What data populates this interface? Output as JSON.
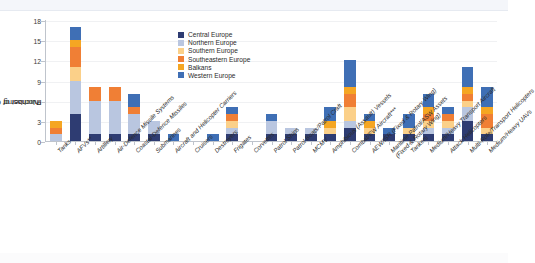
{
  "figure": {
    "ylabel_line1": "Number of Countries",
    "ylabel_line2": "Purchasing"
  },
  "legend": {
    "position": "inside-top-right",
    "items": [
      {
        "label": "Central Europe",
        "color": "#2e3c72"
      },
      {
        "label": "Northern Europe",
        "color": "#b9c6e0"
      },
      {
        "label": "Southern Europe",
        "color": "#fbd089"
      },
      {
        "label": "Southeastern Europe",
        "color": "#f07f35"
      },
      {
        "label": "Balkans",
        "color": "#f5a623"
      },
      {
        "label": "Western Europe",
        "color": "#3f6fb5"
      }
    ]
  },
  "chart_data": {
    "type": "bar",
    "stacked": true,
    "title": "",
    "xlabel": "",
    "ylabel": "Number of Countries Purchasing",
    "ylim": [
      0,
      18
    ],
    "yticks": [
      0,
      3,
      6,
      9,
      12,
      15,
      18
    ],
    "grid": true,
    "categories": [
      "Tanks",
      "AFVs**",
      "Artillery",
      "Air-Defence Missile Systems",
      "Coastal-Defence Missiles",
      "Submarines",
      "Aircraft and Helicopter Carriers",
      "Cruisers",
      "Destroyers",
      "Frigates",
      "Corvettes",
      "Patrol Ships",
      "Patrol Boats/Patrol Craft",
      "MCMV",
      "Amphibious (Assault) Vessels",
      "Combat/EW Aircraft***",
      "AEW/ISR (Fixed & Rotary Wing)",
      "Maritime Patrol/ASW Assets\n(Fixed & Rotary Wing)",
      "Tankers",
      "Medium/Heavy Transport Aircraft",
      "Attack Helicopters",
      "Multi-Role/Transport Helicopters",
      "Medium/Heavy UAVs"
    ],
    "series": [
      {
        "name": "Central Europe",
        "color": "#2e3c72",
        "values": [
          0,
          4,
          1,
          1,
          1,
          1,
          0,
          0,
          0,
          1,
          0,
          1,
          1,
          1,
          1,
          2,
          1,
          1,
          1,
          1,
          1,
          3,
          1
        ]
      },
      {
        "name": "Northern Europe",
        "color": "#b9c6e0",
        "values": [
          1,
          5,
          5,
          5,
          3,
          2,
          0,
          0,
          0,
          1,
          0,
          2,
          1,
          1,
          0,
          1,
          0,
          0,
          0,
          1,
          1,
          2,
          0
        ]
      },
      {
        "name": "Southern Europe",
        "color": "#fbd089",
        "values": [
          0,
          2,
          0,
          0,
          0,
          0,
          0,
          0,
          0,
          1,
          0,
          0,
          0,
          0,
          1,
          2,
          1,
          0,
          1,
          1,
          1,
          1,
          1
        ]
      },
      {
        "name": "Southeastern Europe",
        "color": "#f07f35",
        "values": [
          1,
          3,
          2,
          2,
          1,
          0,
          0,
          0,
          0,
          1,
          0,
          0,
          0,
          0,
          0,
          2,
          0,
          0,
          0,
          1,
          1,
          1,
          2
        ]
      },
      {
        "name": "Balkans",
        "color": "#f5a623",
        "values": [
          1,
          1,
          0,
          0,
          0,
          0,
          0,
          0,
          0,
          0,
          0,
          0,
          0,
          0,
          1,
          1,
          1,
          0,
          0,
          1,
          0,
          1,
          1
        ]
      },
      {
        "name": "Western Europe",
        "color": "#3f6fb5",
        "values": [
          0,
          2,
          0,
          0,
          2,
          0,
          1,
          0,
          1,
          1,
          0,
          1,
          0,
          0,
          2,
          4,
          1,
          1,
          2,
          2,
          1,
          3,
          3
        ]
      }
    ],
    "totals": [
      3,
      17,
      8,
      8,
      7,
      3,
      1,
      0,
      1,
      5,
      0,
      4,
      2,
      2,
      5,
      12,
      4,
      2,
      4,
      7,
      5,
      11,
      8
    ]
  }
}
